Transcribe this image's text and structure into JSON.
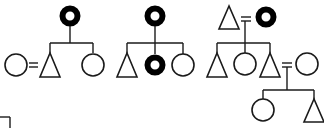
{
  "diagram": {
    "type": "pedigree-chart",
    "legend": {
      "triangle": "male (triangle symbol)",
      "circle": "female (circle symbol)",
      "filled_ring": "affected female",
      "equals": "marriage"
    },
    "colors": {
      "stroke": "#1a1a1a",
      "affected": "#000000",
      "background": "#ffffff"
    },
    "pedigrees": [
      {
        "id": "pedigree-1",
        "label": "Pedigree 1",
        "parent": {
          "sex": "female",
          "affected": true
        },
        "children": [
          {
            "sex": "male",
            "affected": false,
            "spouse": {
              "sex": "female",
              "affected": false
            }
          },
          {
            "sex": "female",
            "affected": false
          }
        ]
      },
      {
        "id": "pedigree-2",
        "label": "Pedigree 2",
        "parent": {
          "sex": "female",
          "affected": true
        },
        "children": [
          {
            "sex": "male",
            "affected": false
          },
          {
            "sex": "female",
            "affected": true
          },
          {
            "sex": "female",
            "affected": false
          }
        ]
      },
      {
        "id": "pedigree-3",
        "label": "Pedigree 3",
        "parents": [
          {
            "sex": "male",
            "affected": false
          },
          {
            "sex": "female",
            "affected": true
          }
        ],
        "children": [
          {
            "sex": "male",
            "affected": false
          },
          {
            "sex": "female",
            "affected": false
          },
          {
            "sex": "male",
            "affected": false,
            "spouse": {
              "sex": "female",
              "affected": false
            },
            "children": [
              {
                "sex": "female",
                "affected": false
              },
              {
                "sex": "male",
                "affected": false
              }
            ]
          }
        ]
      }
    ]
  }
}
